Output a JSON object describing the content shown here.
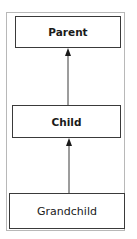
{
  "diagram": {
    "type": "hierarchy",
    "nodes": [
      {
        "id": "parent",
        "label": "Parent"
      },
      {
        "id": "child",
        "label": "Child"
      },
      {
        "id": "grandchild",
        "label": "Grandchild"
      }
    ],
    "edges": [
      {
        "from": "child",
        "to": "parent",
        "arrow": "filled-triangle"
      },
      {
        "from": "grandchild",
        "to": "child",
        "arrow": "filled-triangle"
      }
    ]
  },
  "colors": {
    "border": "#3a3a3a",
    "frame": "#b8b8b8",
    "text": "#1a1a1a"
  }
}
